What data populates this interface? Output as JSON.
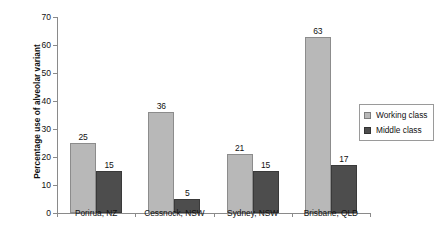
{
  "chart_data": {
    "type": "bar",
    "title": "",
    "subtitle": "",
    "xlabel": "",
    "ylabel": "Percentage use of alveolar variant",
    "ylim": [
      0,
      70
    ],
    "ytick_step": 10,
    "yticks": [
      0,
      10,
      20,
      30,
      40,
      50,
      60,
      70
    ],
    "ytick_labels": [
      "0",
      "10",
      "20",
      "30",
      "40",
      "50",
      "60",
      "70"
    ],
    "grid": false,
    "legend_position": "right-middle",
    "categories": [
      "Porirua, NZ",
      "Cessnock, NSW",
      "Sydney, NSW",
      "Brisbane, QLD"
    ],
    "series": [
      {
        "name": "Working class",
        "color": "#b8b8b8",
        "values": [
          25,
          36,
          21,
          63
        ],
        "value_labels": [
          "25",
          "36",
          "21",
          "63"
        ]
      },
      {
        "name": "Middle class",
        "color": "#4d4d4d",
        "values": [
          15,
          5,
          15,
          17
        ],
        "value_labels": [
          "15",
          "5",
          "15",
          "17"
        ]
      }
    ]
  },
  "legend": {
    "items": [
      {
        "label": "Working class",
        "swatch": "working-class-swatch"
      },
      {
        "label": "Middle class",
        "swatch": "middle-class-swatch"
      }
    ]
  }
}
